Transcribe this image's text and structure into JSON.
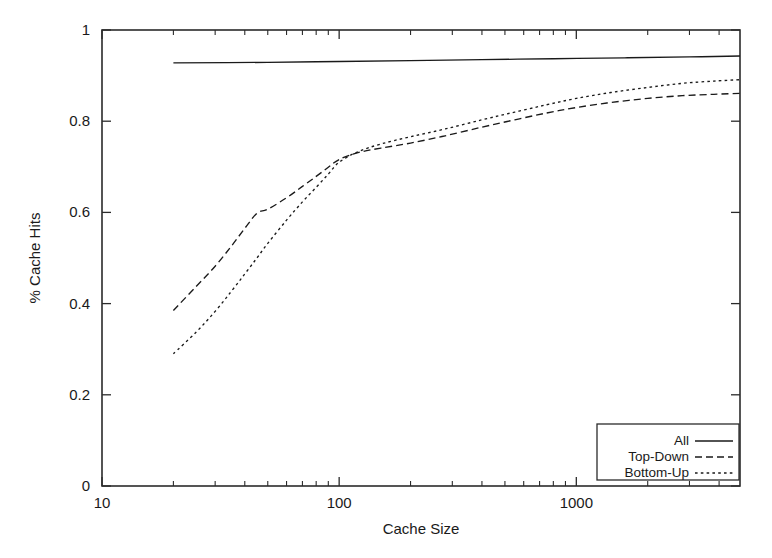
{
  "chart_data": {
    "type": "line",
    "title": "",
    "xlabel": "Cache Size",
    "ylabel": "% Cache Hits",
    "xscale": "log",
    "yscale": "linear",
    "xlim": [
      10,
      4900
    ],
    "ylim": [
      0,
      1
    ],
    "grid": false,
    "legend_position": "bottom-right",
    "x_tick_labels": [
      "10",
      "100",
      "1000"
    ],
    "x_tick_values": [
      10,
      100,
      1000
    ],
    "y_tick_labels": [
      "0",
      "0.2",
      "0.4",
      "0.6",
      "0.8",
      "1"
    ],
    "y_tick_values": [
      0,
      0.2,
      0.4,
      0.6,
      0.8,
      1
    ],
    "series": [
      {
        "name": "All",
        "style": "solid",
        "x": [
          20,
          50,
          100,
          200,
          400,
          800,
          1600,
          3000,
          4900
        ],
        "values": [
          0.928,
          0.929,
          0.931,
          0.933,
          0.935,
          0.937,
          0.939,
          0.941,
          0.943
        ]
      },
      {
        "name": "Top-Down",
        "style": "dashed",
        "x": [
          20,
          25,
          30,
          35,
          40,
          45,
          50,
          60,
          70,
          80,
          90,
          100,
          120,
          150,
          200,
          280,
          400,
          550,
          750,
          1000,
          1400,
          2000,
          2800,
          3800,
          4900
        ],
        "values": [
          0.385,
          0.438,
          0.482,
          0.525,
          0.565,
          0.598,
          0.607,
          0.632,
          0.657,
          0.679,
          0.699,
          0.716,
          0.731,
          0.741,
          0.752,
          0.768,
          0.787,
          0.803,
          0.818,
          0.83,
          0.841,
          0.85,
          0.856,
          0.859,
          0.861
        ]
      },
      {
        "name": "Bottom-Up",
        "style": "dotted",
        "x": [
          20,
          25,
          30,
          35,
          40,
          45,
          50,
          60,
          70,
          80,
          90,
          100,
          120,
          150,
          200,
          280,
          400,
          550,
          750,
          1000,
          1400,
          2000,
          2800,
          3800,
          4900
        ],
        "values": [
          0.29,
          0.338,
          0.383,
          0.426,
          0.465,
          0.5,
          0.532,
          0.583,
          0.623,
          0.655,
          0.684,
          0.71,
          0.733,
          0.75,
          0.766,
          0.783,
          0.803,
          0.82,
          0.836,
          0.85,
          0.863,
          0.874,
          0.883,
          0.888,
          0.891
        ]
      }
    ]
  },
  "legend": {
    "entries": [
      {
        "label": "All",
        "style": "solid"
      },
      {
        "label": "Top-Down",
        "style": "dashed"
      },
      {
        "label": "Bottom-Up",
        "style": "dotted"
      }
    ]
  },
  "axes": {
    "x_title": "Cache Size",
    "y_title": "% Cache Hits"
  }
}
